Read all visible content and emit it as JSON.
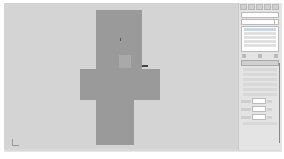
{
  "app": {
    "name": "3ds Max viewport"
  },
  "viewport": {
    "label": "",
    "object": "cross-shaped box mesh",
    "colors": {
      "background": "#d4d4d4",
      "object": "#9a9a9a"
    }
  },
  "command_panel": {
    "toolbar_icons": [
      "create-icon",
      "modify-icon",
      "hierarchy-icon",
      "motion-icon",
      "display-icon",
      "utilities-icon"
    ],
    "name_field": "",
    "modifier_list": "",
    "stack_items": [
      "",
      "",
      "",
      "",
      "",
      ""
    ],
    "rollout_title": "",
    "options": [
      "",
      "",
      "",
      "",
      "",
      "",
      "",
      ""
    ],
    "spinners": [
      {
        "label": "",
        "value": "",
        "unit": ""
      },
      {
        "label": "",
        "value": "",
        "unit": ""
      },
      {
        "label": "",
        "value": "",
        "unit": ""
      }
    ],
    "checkbox": ""
  }
}
